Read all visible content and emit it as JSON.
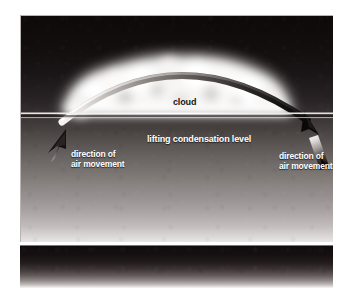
{
  "figure": {
    "type": "orographic-lifting-diagram",
    "labels": {
      "cloud": "cloud",
      "lifting_condensation_level": "lifting condensation level",
      "left_air_movement": "direction of\nair movement",
      "left_air_movement_line1": "direction of",
      "left_air_movement_line2": "air movement",
      "right_air_movement_line1": "direction of",
      "right_air_movement_line2": "air movement"
    },
    "colors": {
      "sky_top": "#0d0a0a",
      "sky_bottom": "#e9e6e5",
      "cloud_fill": "#ffffff",
      "lcl_line": "#ffffff",
      "arc_light_end": "#f2f0ee",
      "arc_dark_end": "#0a0808",
      "label_text": "#ffffff",
      "cloud_label_text": "#151515",
      "page_background": "#ffffff",
      "panel_border": "#b9b4b2"
    },
    "elements": {
      "arc_name": "air-parcel-trajectory-arc",
      "left_arrow_name": "left-air-movement-arrow",
      "right_arrow_name": "right-air-movement-arrow",
      "cloud_name": "cloud-mass",
      "lcl_line_name": "lifting-condensation-level-line"
    }
  }
}
